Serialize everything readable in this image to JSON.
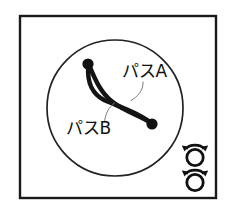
{
  "figure": {
    "title": "",
    "background_color": "#ffffff",
    "frame": {
      "name": "outer-frame",
      "x": 20,
      "y": 16,
      "width": 196,
      "height": 182,
      "stroke_color": "#1a1a1a"
    },
    "region_circle": {
      "name": "region-circle",
      "cx": 115,
      "cy": 108,
      "r": 68,
      "stroke_color": "#222222"
    },
    "nodes": [
      {
        "id": "node-start",
        "cx": 88,
        "cy": 64,
        "r": 5.4,
        "color": "#111111"
      },
      {
        "id": "node-end",
        "cx": 152,
        "cy": 124,
        "r": 5.4,
        "color": "#111111"
      }
    ],
    "paths": [
      {
        "id": "path-a",
        "label": "パスA",
        "label_x": 122,
        "label_y": 77,
        "stroke_color": "#141414",
        "leader": true
      },
      {
        "id": "path-b",
        "label": "パスB",
        "label_x": 66,
        "label_y": 134,
        "stroke_color": "#141414",
        "leader": true
      }
    ],
    "rotation_icons": [
      {
        "id": "rotation-icon-top",
        "cx": 195,
        "cy": 155,
        "ring_r": 8.2,
        "direction": "bidirectional",
        "color": "#111111"
      },
      {
        "id": "rotation-icon-bottom",
        "cx": 195,
        "cy": 180,
        "ring_r": 8.2,
        "direction": "bidirectional",
        "color": "#111111"
      }
    ]
  }
}
